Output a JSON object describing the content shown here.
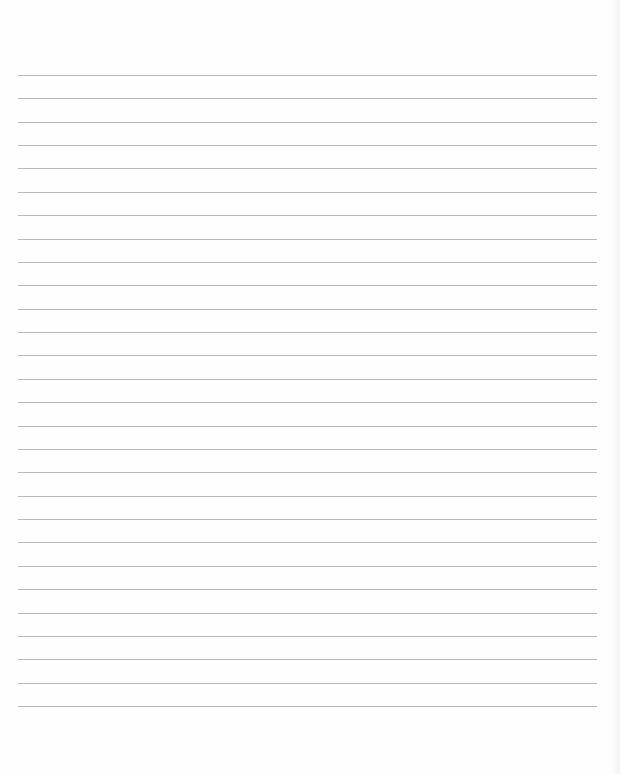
{
  "page": {
    "type": "lined-paper",
    "background_color": "#fefefe",
    "line_color": "#b9b9b9",
    "line_count": 28,
    "first_line_y": 75,
    "line_spacing": 23.37,
    "line_left": 18,
    "line_right": 597,
    "text": ""
  }
}
